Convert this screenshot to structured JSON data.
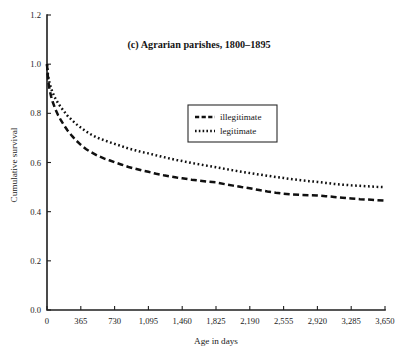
{
  "chart_data": {
    "type": "line",
    "title": "(c) Agrarian parishes, 1800–1895",
    "xlabel": "Age in days",
    "ylabel": "Cumulative survival",
    "xlim": [
      0,
      3650
    ],
    "ylim": [
      0.0,
      1.2
    ],
    "grid": false,
    "legend_position": "upper-center-right",
    "xticks": [
      0,
      365,
      730,
      1095,
      1460,
      1825,
      2190,
      2555,
      2920,
      3285,
      3650
    ],
    "xticklabels": [
      "0",
      "365",
      "730",
      "1,095",
      "1,460",
      "1,825",
      "2,190",
      "2,555",
      "2,920",
      "3,285",
      "3,650"
    ],
    "yticks": [
      0.0,
      0.2,
      0.4,
      0.6,
      0.8,
      1.0,
      1.2
    ],
    "yticklabels": [
      "0.0",
      "0.2",
      "0.4",
      "0.6",
      "0.8",
      "1.0",
      "1.2"
    ],
    "series": [
      {
        "name": "illegitimate",
        "style": "dashed",
        "color": "#101010",
        "x": [
          0,
          10,
          20,
          30,
          45,
          60,
          90,
          120,
          150,
          180,
          220,
          270,
          320,
          365,
          420,
          480,
          550,
          620,
          680,
          730,
          800,
          880,
          950,
          1020,
          1095,
          1180,
          1260,
          1340,
          1400,
          1460,
          1560,
          1650,
          1740,
          1825,
          1920,
          2010,
          2100,
          2190,
          2290,
          2380,
          2470,
          2555,
          2650,
          2740,
          2830,
          2920,
          3010,
          3100,
          3190,
          3285,
          3380,
          3470,
          3560,
          3650
        ],
        "y": [
          1.0,
          0.945,
          0.915,
          0.893,
          0.868,
          0.848,
          0.817,
          0.792,
          0.772,
          0.754,
          0.731,
          0.708,
          0.688,
          0.672,
          0.655,
          0.641,
          0.627,
          0.616,
          0.608,
          0.601,
          0.592,
          0.582,
          0.575,
          0.568,
          0.562,
          0.554,
          0.548,
          0.543,
          0.539,
          0.536,
          0.53,
          0.526,
          0.522,
          0.519,
          0.512,
          0.506,
          0.5,
          0.495,
          0.488,
          0.482,
          0.477,
          0.473,
          0.47,
          0.468,
          0.467,
          0.466,
          0.463,
          0.46,
          0.457,
          0.454,
          0.451,
          0.449,
          0.447,
          0.445
        ]
      },
      {
        "name": "legitimate",
        "style": "dotted",
        "color": "#101010",
        "x": [
          0,
          10,
          20,
          30,
          45,
          60,
          90,
          120,
          150,
          180,
          220,
          270,
          320,
          365,
          420,
          480,
          550,
          620,
          680,
          730,
          800,
          880,
          950,
          1020,
          1095,
          1180,
          1260,
          1340,
          1400,
          1460,
          1560,
          1650,
          1740,
          1825,
          1920,
          2010,
          2100,
          2190,
          2290,
          2380,
          2470,
          2555,
          2650,
          2740,
          2830,
          2920,
          3010,
          3100,
          3190,
          3285,
          3380,
          3470,
          3560,
          3650
        ],
        "y": [
          1.0,
          0.958,
          0.936,
          0.92,
          0.9,
          0.885,
          0.861,
          0.841,
          0.825,
          0.81,
          0.791,
          0.772,
          0.755,
          0.742,
          0.727,
          0.713,
          0.7,
          0.69,
          0.682,
          0.676,
          0.667,
          0.657,
          0.65,
          0.643,
          0.637,
          0.629,
          0.622,
          0.615,
          0.61,
          0.606,
          0.598,
          0.592,
          0.586,
          0.581,
          0.574,
          0.568,
          0.562,
          0.557,
          0.551,
          0.546,
          0.541,
          0.537,
          0.532,
          0.528,
          0.524,
          0.521,
          0.517,
          0.513,
          0.51,
          0.507,
          0.505,
          0.503,
          0.501,
          0.5
        ]
      }
    ]
  },
  "legend": {
    "entries": [
      {
        "label": "illegitimate"
      },
      {
        "label": "legitimate"
      }
    ]
  }
}
